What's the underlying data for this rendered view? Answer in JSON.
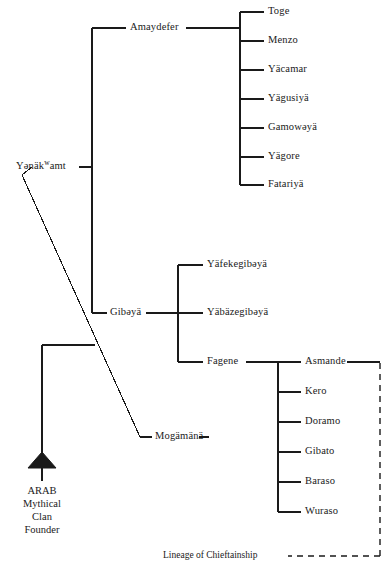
{
  "diagram": {
    "type": "genealogical-lineage-tree",
    "title_caption": "Lineage of Chieftainship",
    "line_color": "#1a1a1a",
    "background_color": "#ffffff"
  },
  "founder": {
    "symbol": "filled-triangle",
    "label": "ARAB\nMythical\nClan\nFounder",
    "lines": [
      "ARAB",
      "Mythical",
      "Clan",
      "Founder"
    ]
  },
  "nodes": {
    "root": {
      "id": "yenakwamt",
      "name_prefix": "Yənäk",
      "name_superscript": "w",
      "name_suffix": "amt",
      "name_full": "Yənäkʷamt"
    },
    "generation2": [
      {
        "id": "amaydefer",
        "name": "Amaydefer"
      },
      {
        "id": "gibeya",
        "name": "Gibəyä"
      },
      {
        "id": "mogamana",
        "name": "Mogämänä"
      }
    ],
    "amaydefer_children": [
      {
        "id": "toge",
        "name": "Toge"
      },
      {
        "id": "menzo",
        "name": "Menzo"
      },
      {
        "id": "yacamar",
        "name": "Yäcamar"
      },
      {
        "id": "yagusiya",
        "name": "Yägusiyä"
      },
      {
        "id": "gamoweya",
        "name": "Gamowəyä"
      },
      {
        "id": "yagore",
        "name": "Yägore"
      },
      {
        "id": "fatariya",
        "name": "Fatariyä"
      }
    ],
    "gibeya_children": [
      {
        "id": "yafekegibeya",
        "name": "Yäfekegibəyä"
      },
      {
        "id": "yabazegibeya",
        "name": "Yäbäzegibəyä"
      },
      {
        "id": "fagene",
        "name": "Fagene"
      }
    ],
    "fagene_children": [
      {
        "id": "asmande",
        "name": "Asmande"
      },
      {
        "id": "kero",
        "name": "Kero"
      },
      {
        "id": "doramo",
        "name": "Doramo"
      },
      {
        "id": "gibato",
        "name": "Gibato"
      },
      {
        "id": "baraso",
        "name": "Baraso"
      },
      {
        "id": "wuraso",
        "name": "Wuraso"
      }
    ]
  },
  "legend": {
    "chieftainship_label": "Lineage of Chieftainship",
    "chieftainship_line_style": "dashed"
  }
}
